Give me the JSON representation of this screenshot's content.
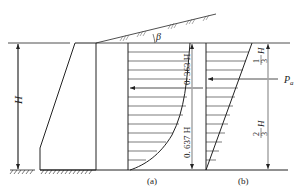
{
  "figure": {
    "type": "retaining-wall-earth-pressure-diagram",
    "colors": {
      "line": "#222222",
      "background": "#ffffff"
    },
    "labels": {
      "height": "H",
      "slope_angle": "β",
      "force": "P",
      "force_sub": "a",
      "panel_a": "(a)",
      "panel_b": "(b)",
      "dim_a_upper": "0. 363 H",
      "dim_a_lower": "0. 637 H",
      "dim_b_upper_num": "1",
      "dim_b_upper_den": "3",
      "dim_b_upper_var": "H",
      "dim_b_lower_num": "2",
      "dim_b_lower_den": "3",
      "dim_b_lower_var": "H"
    },
    "panels": [
      {
        "id": "a",
        "distribution": "curved (parabolic-like)",
        "resultant_position_from_top": "0.363H",
        "resultant_position_from_bottom": "0.637H"
      },
      {
        "id": "b",
        "distribution": "triangular (linear)",
        "resultant_position_from_top": "1/3 H",
        "resultant_position_from_bottom": "2/3 H"
      }
    ]
  }
}
